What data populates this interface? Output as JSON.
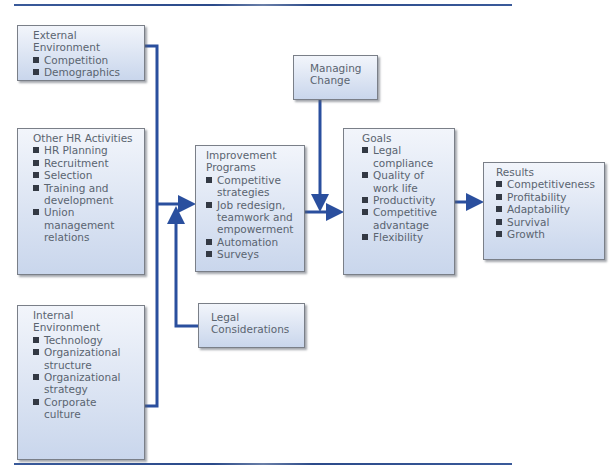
{
  "diagram": {
    "boxes": {
      "external": {
        "title_line1": "External",
        "title_line2": "Environment",
        "items": [
          "Competition",
          "Demographics"
        ]
      },
      "other_hr": {
        "title": "Other HR Activities",
        "items": [
          "HR Planning",
          "Recruitment",
          "Selection",
          "Training and development",
          "Union management relations"
        ]
      },
      "internal": {
        "title_line1": "Internal",
        "title_line2": "Environment",
        "items": [
          "Technology",
          "Organizational structure",
          "Organizational strategy",
          "Corporate culture"
        ]
      },
      "improvement": {
        "title_line1": "Improvement",
        "title_line2": "Programs",
        "items": [
          "Competitive strategies",
          "Job redesign, teamwork and empowerment",
          "Automation",
          "Surveys"
        ]
      },
      "legal": {
        "title_line1": "Legal",
        "title_line2": "Considerations"
      },
      "managing_change": {
        "title_line1": "Managing",
        "title_line2": "Change"
      },
      "goals": {
        "title": "Goals",
        "items": [
          "Legal compliance",
          "Quality of work life",
          "Productivity",
          "Competitive advantage",
          "Flexibility"
        ]
      },
      "results": {
        "title": "Results",
        "items": [
          "Competitiveness",
          "Profitability",
          "Adaptability",
          "Survival",
          "Growth"
        ]
      }
    },
    "colors": {
      "connector": "#2a4f9e",
      "box_top": "#f2f5fb",
      "box_bottom": "#c9d6ec",
      "box_border": "#7a7f88",
      "text": "#5a6470",
      "bullet": "#333944"
    }
  }
}
